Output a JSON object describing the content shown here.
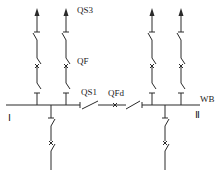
{
  "diagram": {
    "type": "single-bus-sectionalized-with-bus-tie",
    "labels": {
      "disconnector": "QS3",
      "breaker": "QF",
      "bus_tie_disconnector": "QS1",
      "bus_tie_breaker": "QFd",
      "busbar": "WB",
      "section_left": "Ⅰ",
      "section_right": "Ⅱ"
    },
    "outgoing_feeders_top": [
      {
        "id": "feeder-1",
        "section": "Ⅰ"
      },
      {
        "id": "feeder-2",
        "section": "Ⅰ"
      },
      {
        "id": "feeder-3",
        "section": "Ⅱ"
      },
      {
        "id": "feeder-4",
        "section": "Ⅱ"
      }
    ],
    "incoming_feeders_bottom": [
      {
        "id": "incoming-1",
        "section": "Ⅰ"
      },
      {
        "id": "incoming-2",
        "section": "Ⅱ"
      }
    ]
  }
}
